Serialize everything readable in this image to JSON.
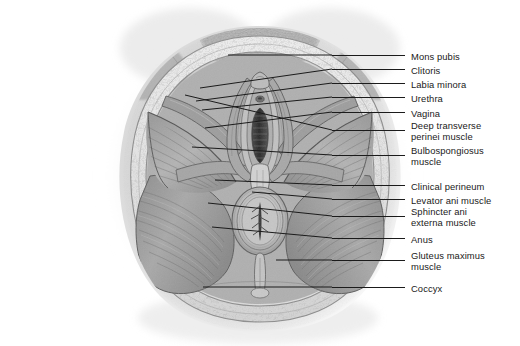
{
  "figure": {
    "background_color": "#ffffff",
    "text_color": "#1a1a1a",
    "leader_color": "#1b1b1b",
    "style": "grayscale anatomical illustration"
  },
  "labels": [
    {
      "id": "mons-pubis",
      "text": "Mons pubis",
      "text2": "",
      "text_x": 411,
      "text_y": 51,
      "tick_y": 55,
      "tick_x1": 332,
      "tick_x2": 405,
      "lead_x": 228,
      "lead_y": 55
    },
    {
      "id": "clitoris",
      "text": "Clitoris",
      "text2": "",
      "text_x": 411,
      "text_y": 65,
      "tick_y": 69,
      "tick_x1": 332,
      "tick_x2": 405,
      "lead_x": 200,
      "lead_y": 88
    },
    {
      "id": "labia-minora",
      "text": "Labia minora",
      "text2": "",
      "text_x": 411,
      "text_y": 79,
      "tick_y": 83,
      "tick_x1": 332,
      "tick_x2": 405,
      "lead_x": 196,
      "lead_y": 101
    },
    {
      "id": "urethra",
      "text": "Urethra",
      "text2": "",
      "text_x": 411,
      "text_y": 93,
      "tick_y": 97,
      "tick_x1": 332,
      "tick_x2": 405,
      "lead_x": 202,
      "lead_y": 110
    },
    {
      "id": "vagina",
      "text": "Vagina",
      "text2": "",
      "text_x": 411,
      "text_y": 108,
      "tick_y": 112,
      "tick_x1": 332,
      "tick_x2": 405,
      "lead_x": 205,
      "lead_y": 128
    },
    {
      "id": "deep-transverse-perinei-muscle",
      "text": "Deep transverse",
      "text2": "perinei muscle",
      "text_x": 411,
      "text_y": 120,
      "tick_y": 130,
      "tick_x1": 332,
      "tick_x2": 405,
      "lead_x": 185,
      "lead_y": 95
    },
    {
      "id": "bulbospongiosus-muscle",
      "text": "Bulbospongiosus",
      "text2": "muscle",
      "text_x": 411,
      "text_y": 145,
      "tick_y": 155,
      "tick_x1": 332,
      "tick_x2": 405,
      "lead_x": 192,
      "lead_y": 147
    },
    {
      "id": "clinical-perineum",
      "text": "Clinical perineum",
      "text2": "",
      "text_x": 411,
      "text_y": 181,
      "tick_y": 185,
      "tick_x1": 332,
      "tick_x2": 405,
      "lead_x": 215,
      "lead_y": 180
    },
    {
      "id": "levator-ani-muscle",
      "text": "Levator ani muscle",
      "text2": "",
      "text_x": 411,
      "text_y": 195,
      "tick_y": 199,
      "tick_x1": 332,
      "tick_x2": 405,
      "lead_x": 252,
      "lead_y": 192
    },
    {
      "id": "sphincter-ani-externa-muscle",
      "text": "Sphincter ani",
      "text2": "externa muscle",
      "text_x": 411,
      "text_y": 206,
      "tick_y": 216,
      "tick_x1": 332,
      "tick_x2": 405,
      "lead_x": 208,
      "lead_y": 203
    },
    {
      "id": "anus",
      "text": "Anus",
      "text2": "",
      "text_x": 411,
      "text_y": 234,
      "tick_y": 238,
      "tick_x1": 332,
      "tick_x2": 405,
      "lead_x": 212,
      "lead_y": 227
    },
    {
      "id": "gluteus-maximus-muscle",
      "text": "Gluteus maximus",
      "text2": "muscle",
      "text_x": 411,
      "text_y": 250,
      "tick_y": 260,
      "tick_x1": 332,
      "tick_x2": 405,
      "lead_x": 276,
      "lead_y": 260
    },
    {
      "id": "coccyx",
      "text": "Coccyx",
      "text2": "",
      "text_x": 411,
      "text_y": 283,
      "tick_y": 287,
      "tick_x1": 332,
      "tick_x2": 405,
      "lead_x": 203,
      "lead_y": 287
    }
  ]
}
